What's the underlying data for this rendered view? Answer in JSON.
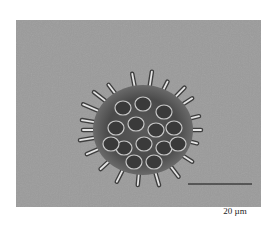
{
  "image": {
    "subject": "colonial green alga micrograph (spiny colony)",
    "background_color": "#9a9a9a"
  },
  "scale_bar": {
    "label": "20 µm",
    "color": "#111111"
  }
}
